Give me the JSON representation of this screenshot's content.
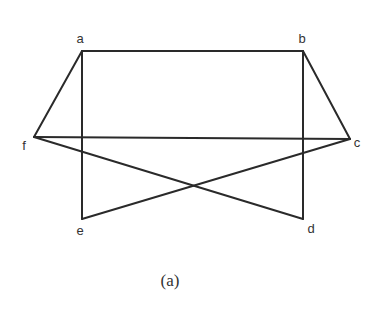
{
  "figure": {
    "caption": "(a)",
    "stroke_color": "#2a2a2a",
    "label_color": "#333333",
    "background": "#ffffff"
  },
  "graph": {
    "vertices": [
      {
        "id": "a",
        "label": "a",
        "x": 82,
        "y": 51,
        "lx": 80,
        "ly": 43
      },
      {
        "id": "b",
        "label": "b",
        "x": 303,
        "y": 51,
        "lx": 302,
        "ly": 43
      },
      {
        "id": "c",
        "label": "c",
        "x": 350,
        "y": 139,
        "lx": 357,
        "ly": 147
      },
      {
        "id": "d",
        "label": "d",
        "x": 303,
        "y": 219,
        "lx": 311,
        "ly": 233
      },
      {
        "id": "e",
        "label": "e",
        "x": 82,
        "y": 219,
        "lx": 80,
        "ly": 235
      },
      {
        "id": "f",
        "label": "f",
        "x": 34,
        "y": 137,
        "lx": 24,
        "ly": 150
      }
    ],
    "edges": [
      {
        "from": "a",
        "to": "b"
      },
      {
        "from": "a",
        "to": "f"
      },
      {
        "from": "a",
        "to": "e"
      },
      {
        "from": "b",
        "to": "c"
      },
      {
        "from": "b",
        "to": "d"
      },
      {
        "from": "f",
        "to": "c"
      },
      {
        "from": "f",
        "to": "d"
      },
      {
        "from": "c",
        "to": "e"
      }
    ]
  }
}
